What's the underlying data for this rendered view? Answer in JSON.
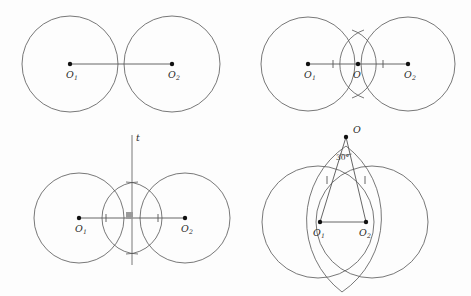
{
  "figure": {
    "background_color": "#fdfdfd",
    "stroke_color": "#555555",
    "accent_color": "#111111",
    "width": 471,
    "height": 296
  },
  "panels": [
    {
      "id": "panel-top-left",
      "name": "step-1-two-tangent-circles",
      "circles": [
        {
          "name": "circle-o1",
          "cx": 70,
          "cy": 64,
          "r": 48
        },
        {
          "name": "circle-o2",
          "cx": 172,
          "cy": 64,
          "r": 48
        }
      ],
      "points": [
        {
          "name": "point-o1",
          "x": 70,
          "y": 64,
          "label": "O",
          "sub": "1",
          "lx": 66,
          "ly": 78,
          "sx": 74,
          "sy": 80
        },
        {
          "name": "point-o2",
          "x": 172,
          "y": 64,
          "label": "O",
          "sub": "2",
          "lx": 168,
          "ly": 78,
          "sx": 176,
          "sy": 80
        }
      ],
      "segments": [
        {
          "name": "segment-o1-o2",
          "x1": 70,
          "y1": 64,
          "x2": 172,
          "y2": 64
        }
      ],
      "ticks": [],
      "extra_labels": []
    },
    {
      "id": "panel-top-right",
      "name": "step-2-midpoint-arcs",
      "circles": [
        {
          "name": "circle-o1",
          "cx": 308,
          "cy": 64,
          "r": 47
        },
        {
          "name": "circle-o2",
          "cx": 408,
          "cy": 64,
          "r": 47
        }
      ],
      "points": [
        {
          "name": "point-o1",
          "x": 308,
          "y": 64,
          "label": "O",
          "sub": "1",
          "lx": 304,
          "ly": 78,
          "sx": 312,
          "sy": 80
        },
        {
          "name": "point-o-mid",
          "x": 358,
          "y": 64,
          "label": "O",
          "sub": "",
          "lx": 353,
          "ly": 78,
          "sx": 0,
          "sy": 0
        },
        {
          "name": "point-o2",
          "x": 408,
          "y": 64,
          "label": "O",
          "sub": "2",
          "lx": 404,
          "ly": 78,
          "sx": 412,
          "sy": 80
        }
      ],
      "segments": [
        {
          "name": "segment-o1-o2",
          "x1": 308,
          "y1": 64,
          "x2": 408,
          "y2": 64
        }
      ],
      "ticks": [
        {
          "name": "tick-left",
          "x": 333,
          "y": 64
        },
        {
          "name": "tick-right",
          "x": 383,
          "y": 64
        }
      ],
      "extra_labels": []
    },
    {
      "id": "panel-bottom-left",
      "name": "step-3-perpendicular-bisector",
      "circles": [
        {
          "name": "circle-o1",
          "cx": 79,
          "cy": 218,
          "r": 45
        },
        {
          "name": "circle-o2",
          "cx": 185,
          "cy": 218,
          "r": 45
        }
      ],
      "points": [
        {
          "name": "point-o1",
          "x": 79,
          "y": 218,
          "label": "O",
          "sub": "1",
          "lx": 75,
          "ly": 232,
          "sx": 83,
          "sy": 234
        },
        {
          "name": "point-o2",
          "x": 185,
          "y": 218,
          "label": "O",
          "sub": "2",
          "lx": 181,
          "ly": 232,
          "sx": 189,
          "sy": 234
        }
      ],
      "segments": [
        {
          "name": "segment-o1-o2",
          "x1": 79,
          "y1": 218,
          "x2": 185,
          "y2": 218
        }
      ],
      "ticks": [
        {
          "name": "tick-left",
          "x": 106,
          "y": 218
        },
        {
          "name": "tick-right",
          "x": 158,
          "y": 218
        }
      ],
      "line_t": {
        "name": "line-t",
        "x": 132,
        "y1": 135,
        "y2": 265,
        "label": "t",
        "lx": 136,
        "ly": 141
      },
      "right_angle": {
        "name": "right-angle-mark",
        "x": 126,
        "y": 212,
        "size": 7
      },
      "extra_labels": []
    },
    {
      "id": "panel-bottom-right",
      "name": "step-4-thirty-degree-apex",
      "circles": [
        {
          "name": "circle-big-left",
          "cx": 318,
          "cy": 222,
          "r": 56
        },
        {
          "name": "circle-big-right",
          "cx": 372,
          "cy": 222,
          "r": 56
        },
        {
          "name": "circle-lens",
          "cx": 345,
          "cy": 222,
          "r": 0
        }
      ],
      "points": [
        {
          "name": "point-apex-o",
          "x": 346,
          "y": 137,
          "label": "O",
          "sub": "",
          "lx": 353,
          "ly": 133,
          "sx": 0,
          "sy": 0
        },
        {
          "name": "point-o1",
          "x": 320,
          "y": 222,
          "label": "O",
          "sub": "1",
          "lx": 313,
          "ly": 236,
          "sx": 321,
          "sy": 238
        },
        {
          "name": "point-o2",
          "x": 366,
          "y": 222,
          "label": "O",
          "sub": "2",
          "lx": 359,
          "ly": 236,
          "sx": 367,
          "sy": 238
        }
      ],
      "segments": [
        {
          "name": "segment-o1-o2",
          "x1": 320,
          "y1": 222,
          "x2": 366,
          "y2": 222
        },
        {
          "name": "segment-apex-o1",
          "x1": 346,
          "y1": 137,
          "x2": 320,
          "y2": 222
        },
        {
          "name": "segment-apex-o2",
          "x1": 346,
          "y1": 137,
          "x2": 366,
          "y2": 222
        }
      ],
      "ticks": [
        {
          "name": "tick-left-ray",
          "x": 327,
          "y": 180
        },
        {
          "name": "tick-right-ray",
          "x": 365,
          "y": 180
        }
      ],
      "angle": {
        "name": "angle-label-30",
        "text": "30°",
        "lx": 336,
        "ly": 160,
        "arc_r": 17
      },
      "extra_labels": []
    }
  ]
}
